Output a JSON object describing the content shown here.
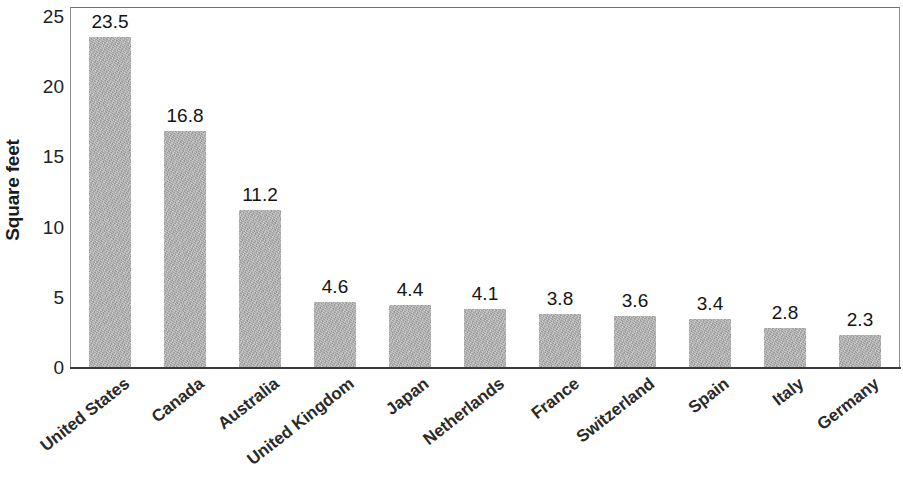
{
  "chart_data": {
    "type": "bar",
    "title": "",
    "subtitle": "",
    "xlabel": "",
    "ylabel": "Square feet",
    "categories": [
      "United States",
      "Canada",
      "Australia",
      "United Kingdom",
      "Japan",
      "Netherlands",
      "France",
      "Switzerland",
      "Spain",
      "Italy",
      "Germany"
    ],
    "values": [
      23.5,
      16.8,
      11.2,
      4.6,
      4.4,
      4.1,
      3.8,
      3.6,
      3.4,
      2.8,
      2.3
    ],
    "value_labels": [
      "23.5",
      "16.8",
      "11.2",
      "4.6",
      "4.4",
      "4.1",
      "3.8",
      "3.6",
      "3.4",
      "2.8",
      "2.3"
    ],
    "ylim": [
      0,
      25
    ],
    "ytick_labels": [
      "25",
      "20",
      "15",
      "10",
      "5",
      "0"
    ],
    "ytick_values": [
      25,
      20,
      15,
      10,
      5,
      0
    ],
    "grid": false,
    "legend": null,
    "bar_color": "#adadad",
    "axis_color": "#3a3a3a",
    "text_color": "#1b1b1b"
  }
}
